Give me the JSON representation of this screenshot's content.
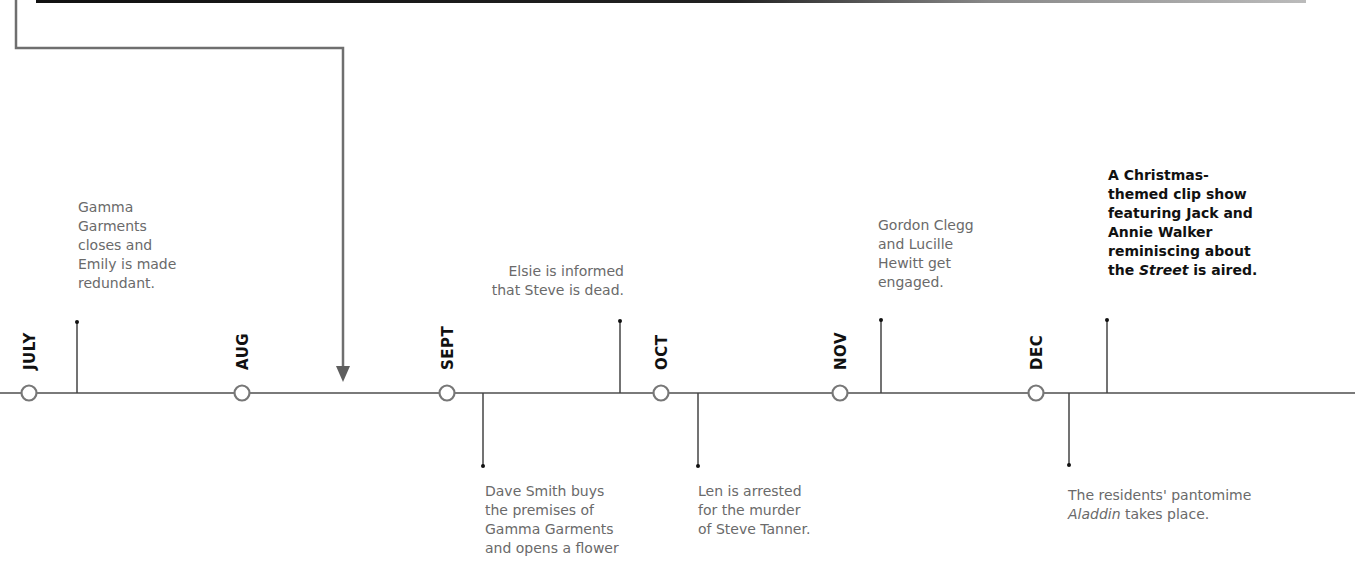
{
  "diagram": {
    "type": "timeline",
    "colors": {
      "axis": "#777777",
      "stem": "#333333",
      "text": "#6a6a6a",
      "highlight_text": "#111111",
      "month_label": "#111111"
    },
    "months": [
      {
        "label": "JULY",
        "x": 29
      },
      {
        "label": "AUG",
        "x": 242
      },
      {
        "label": "SEPT",
        "x": 447
      },
      {
        "label": "OCT",
        "x": 661
      },
      {
        "label": "NOV",
        "x": 840
      },
      {
        "label": "DEC",
        "x": 1036
      }
    ],
    "events": [
      {
        "id": "e1",
        "position": "above",
        "text": "Gamma Garments closes and Emily is made redundant."
      },
      {
        "id": "e2",
        "position": "below",
        "text": "Dave Smith buys the premises of Gamma Garments and opens a flower"
      },
      {
        "id": "e3",
        "position": "above",
        "text": "Elsie is informed that Steve is dead."
      },
      {
        "id": "e4",
        "position": "below",
        "text": "Len is arrested for the murder of Steve Tanner."
      },
      {
        "id": "e5",
        "position": "above",
        "text": "Gordon Clegg and Lucille Hewitt get engaged."
      },
      {
        "id": "e6",
        "position": "below",
        "text_prefix": "The residents' pantomime",
        "text_italic": "Aladdin",
        "text_suffix": "takes place."
      },
      {
        "id": "e7",
        "position": "above",
        "emphasis": true,
        "text_prefix": "A Christmas-themed clip show featuring Jack and Annie Walker reminiscing about the",
        "text_italic": "Street",
        "text_suffix": "is aired."
      }
    ]
  },
  "labels": {
    "e1_lines": [
      "Gamma",
      "Garments",
      "closes and",
      "Emily is made",
      "redundant."
    ],
    "e2_lines": [
      "Dave Smith buys",
      "the premises of",
      "Gamma Garments",
      "and opens a flower"
    ],
    "e3_lines": [
      "Elsie is informed",
      "that Steve is dead."
    ],
    "e4_lines": [
      "Len is arrested",
      "for the murder",
      "of Steve Tanner."
    ],
    "e5_lines": [
      "Gordon Clegg",
      "and Lucille",
      "Hewitt get",
      "engaged."
    ],
    "e6_line1": "The residents' pantomime",
    "e6_italic": "Aladdin",
    "e6_suffix": " takes place.",
    "e7_lines": [
      "A Christmas-",
      "themed clip show",
      "featuring Jack and",
      "Annie Walker",
      "reminiscing about"
    ],
    "e7_prefix": "the ",
    "e7_italic": "Street",
    "e7_suffix": " is aired."
  }
}
